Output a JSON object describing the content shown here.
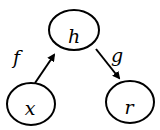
{
  "diagram": {
    "type": "directed-graph",
    "nodes": [
      {
        "id": "h",
        "label": "h"
      },
      {
        "id": "x",
        "label": "x"
      },
      {
        "id": "r",
        "label": "r"
      }
    ],
    "edges": [
      {
        "from": "x",
        "to": "h",
        "label": "f"
      },
      {
        "from": "h",
        "to": "r",
        "label": "g"
      }
    ],
    "colors": {
      "stroke": "#000000",
      "background": "#ffffff"
    }
  }
}
